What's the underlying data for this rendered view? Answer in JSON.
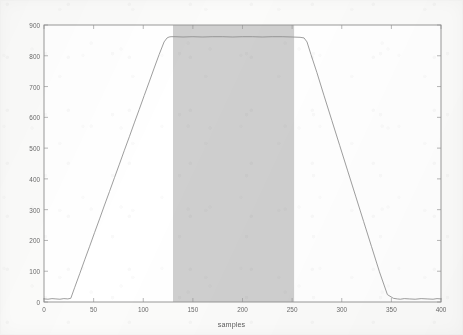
{
  "chart_data": {
    "type": "line",
    "title": "",
    "xlabel": "samples",
    "ylabel": "Stimulus profile (degrees/second)",
    "xlim": [
      0,
      400
    ],
    "ylim": [
      0,
      900
    ],
    "xticks": [
      0,
      50,
      100,
      150,
      200,
      250,
      300,
      350,
      400
    ],
    "yticks": [
      0,
      100,
      200,
      300,
      400,
      500,
      600,
      700,
      800,
      900
    ],
    "grid": false,
    "legend": null,
    "line_color": "#8c8c8c",
    "background_color": "#ffffff",
    "series": [
      {
        "name": "stimulus profile",
        "description": "Trapezoidal velocity profile: low-noise baseline, linear ramp up, flat plateau, linear ramp down, low-noise baseline.",
        "x": [
          0,
          4,
          8,
          12,
          16,
          20,
          24,
          27,
          31,
          36,
          41,
          46,
          51,
          56,
          61,
          66,
          71,
          76,
          81,
          86,
          91,
          96,
          101,
          106,
          111,
          116,
          121,
          124,
          126,
          128,
          132,
          140,
          150,
          160,
          170,
          180,
          190,
          200,
          210,
          220,
          230,
          240,
          250,
          258,
          262,
          265,
          269,
          275,
          282,
          290,
          298,
          306,
          314,
          322,
          330,
          338,
          346,
          352,
          356,
          359,
          363,
          368,
          374,
          380,
          386,
          392,
          396,
          400
        ],
        "y": [
          10,
          9,
          11,
          10,
          9,
          11,
          10,
          12,
          48,
          92,
          137,
          181,
          226,
          270,
          315,
          359,
          404,
          448,
          493,
          537,
          582,
          626,
          671,
          715,
          760,
          804,
          845,
          858,
          861,
          862,
          862,
          861,
          862,
          861,
          862,
          862,
          861,
          862,
          862,
          861,
          862,
          862,
          861,
          860,
          858,
          845,
          804,
          745,
          672,
          590,
          508,
          426,
          344,
          262,
          180,
          98,
          24,
          12,
          10,
          9,
          11,
          10,
          9,
          11,
          10,
          9,
          11,
          10
        ]
      }
    ],
    "shaded_regions": [
      {
        "name": "flat region",
        "label": "flat region",
        "x_start": 130,
        "x_end": 252,
        "y_start": 0,
        "y_end": 900,
        "color": "#cfcfcf",
        "label_x": 191,
        "label_y": 445
      }
    ]
  },
  "axes": {
    "y_title": "Stimulus profile (degrees/second)",
    "x_title": "samples",
    "y_tick_labels": [
      "0",
      "100",
      "200",
      "300",
      "400",
      "500",
      "600",
      "700",
      "800",
      "900"
    ],
    "x_tick_labels": [
      "0",
      "50",
      "100",
      "150",
      "200",
      "250",
      "300",
      "350",
      "400"
    ]
  },
  "annotations": {
    "flat_region": "flat region"
  }
}
